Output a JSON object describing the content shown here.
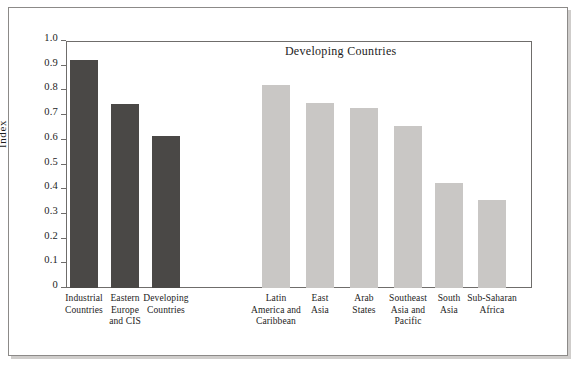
{
  "chart_data": {
    "type": "bar",
    "title": "",
    "xlabel": "",
    "ylabel": "Index",
    "ylim": [
      0,
      1.0
    ],
    "ytick_labels": [
      "1.0",
      "0.9",
      "0.8",
      "0.7",
      "0.6",
      "0.5",
      "0.4",
      "0.3",
      "0.2",
      "0.1",
      "0"
    ],
    "ytick_values": [
      1.0,
      0.9,
      0.8,
      0.7,
      0.6,
      0.5,
      0.4,
      0.3,
      0.2,
      0.1,
      0
    ],
    "grid": false,
    "legend": "none",
    "annotations": [
      {
        "text": "Developing Countries",
        "x_frac": 0.62,
        "y_value": 0.96
      }
    ],
    "groups": [
      {
        "name": "aggregates",
        "color": "#4a4846",
        "categories": [
          "Industrial\nCountries",
          "Eastern\nEurope\nand CIS",
          "Developing\nCountries"
        ],
        "values": [
          0.925,
          0.745,
          0.617
        ]
      },
      {
        "name": "Developing Countries",
        "color": "#c9c7c5",
        "categories": [
          "Latin\nAmerica and\nCaribbean",
          "East\nAsia",
          "Arab\nStates",
          "Southeast\nAsia and\nPacific",
          "South\nAsia",
          "Sub-Saharan\nAfrica"
        ],
        "values": [
          0.82,
          0.75,
          0.728,
          0.655,
          0.425,
          0.355
        ]
      }
    ],
    "categories": [
      "Industrial\nCountries",
      "Eastern\nEurope\nand CIS",
      "Developing\nCountries",
      "Latin\nAmerica and\nCaribbean",
      "East\nAsia",
      "Arab\nStates",
      "Southeast\nAsia and\nPacific",
      "South\nAsia",
      "Sub-Saharan\nAfrica"
    ],
    "values": [
      0.925,
      0.745,
      0.617,
      0.82,
      0.75,
      0.728,
      0.655,
      0.425,
      0.355
    ],
    "bar_colors": [
      "#4a4846",
      "#4a4846",
      "#4a4846",
      "#c9c7c5",
      "#c9c7c5",
      "#c9c7c5",
      "#c9c7c5",
      "#c9c7c5",
      "#c9c7c5"
    ]
  },
  "colors": {
    "dark_bar": "#4a4846",
    "light_bar": "#c9c7c5",
    "axis": "#6f6d6b",
    "frame": "#8c8a88",
    "text": "#1c1c1c",
    "background": "#ffffff"
  }
}
